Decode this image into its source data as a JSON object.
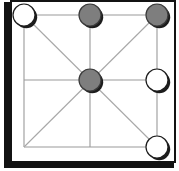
{
  "board": {
    "title": "Three Men's Morris board position",
    "rows": 3,
    "cols": 3,
    "colors": {
      "background": "#ffffff",
      "frame": "#131313",
      "frame_shadow": "#121212",
      "grid_line": "#9a9a9a",
      "diagonal_line": "#a8a8a8",
      "piece_white_fill": "#ffffff",
      "piece_white_stroke": "#1c1c1c",
      "piece_gray_fill": "#7e7e7e",
      "piece_gray_stroke": "#3a3a3a",
      "piece_shadow": "#1c1c1c"
    },
    "geometry": {
      "panel_left": 10,
      "panel_top": 0,
      "panel_width": 166,
      "panel_height": 163,
      "cell_xs": [
        24,
        90,
        157
      ],
      "cell_ys": [
        15,
        80,
        147
      ],
      "piece_radius": 11
    },
    "points": [
      {
        "id": "a3",
        "name": "top-left",
        "row": 0,
        "col": 0,
        "cx": 24,
        "cy": 15,
        "state": "white",
        "label": "white piece"
      },
      {
        "id": "b3",
        "name": "top-center",
        "row": 0,
        "col": 1,
        "cx": 90,
        "cy": 15,
        "state": "gray",
        "label": "gray piece"
      },
      {
        "id": "c3",
        "name": "top-right",
        "row": 0,
        "col": 2,
        "cx": 157,
        "cy": 15,
        "state": "gray",
        "label": "gray piece"
      },
      {
        "id": "a2",
        "name": "middle-left",
        "row": 1,
        "col": 0,
        "cx": 24,
        "cy": 80,
        "state": "empty",
        "label": "empty point"
      },
      {
        "id": "b2",
        "name": "center",
        "row": 1,
        "col": 1,
        "cx": 90,
        "cy": 80,
        "state": "gray",
        "label": "gray piece"
      },
      {
        "id": "c2",
        "name": "middle-right",
        "row": 1,
        "col": 2,
        "cx": 157,
        "cy": 80,
        "state": "white",
        "label": "white piece"
      },
      {
        "id": "a1",
        "name": "bottom-left",
        "row": 2,
        "col": 0,
        "cx": 24,
        "cy": 147,
        "state": "empty",
        "label": "empty point"
      },
      {
        "id": "b1",
        "name": "bottom-center",
        "row": 2,
        "col": 1,
        "cx": 90,
        "cy": 147,
        "state": "empty",
        "label": "empty point"
      },
      {
        "id": "c1",
        "name": "bottom-right",
        "row": 2,
        "col": 2,
        "cx": 157,
        "cy": 147,
        "state": "white",
        "label": "white piece"
      }
    ],
    "counts": {
      "white_pieces": 3,
      "gray_pieces": 3,
      "empty_points": 3
    },
    "lines": {
      "horizontal_ys": [
        15,
        80,
        147
      ],
      "vertical_xs": [
        24,
        90,
        157
      ],
      "diagonals": [
        {
          "from": "a3",
          "to": "c1"
        },
        {
          "from": "c3",
          "to": "a1"
        },
        {
          "from": "b3",
          "to": "b1"
        },
        {
          "from": "a2",
          "to": "c2"
        }
      ]
    }
  }
}
